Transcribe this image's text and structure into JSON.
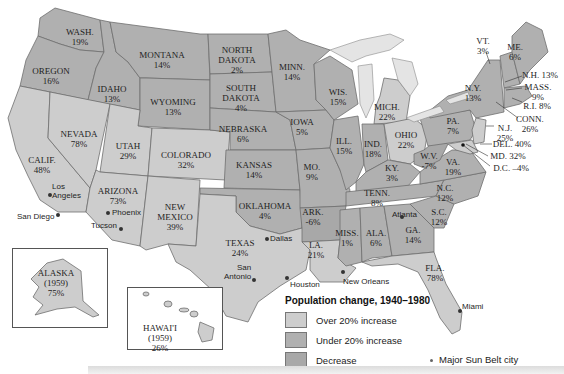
{
  "legend": {
    "title": "Population change, 1940–1980",
    "items": [
      {
        "label": "Over 20% increase",
        "color": "#cdcdcd"
      },
      {
        "label": "Under 20% increase",
        "color": "#b0b0b0"
      },
      {
        "label": "Decrease",
        "color": "#a8a8a8"
      }
    ],
    "city_marker_label": "Major Sun Belt city"
  },
  "states": {
    "wash": {
      "name": "WASH.",
      "value": "19%"
    },
    "oregon": {
      "name": "OREGON",
      "value": "16%"
    },
    "idaho": {
      "name": "IDAHO",
      "value": "13%"
    },
    "montana": {
      "name": "MONTANA",
      "value": "14%"
    },
    "wyoming": {
      "name": "WYOMING",
      "value": "13%"
    },
    "nevada": {
      "name": "NEVADA",
      "value": "78%"
    },
    "calif": {
      "name": "CALIF.",
      "value": "48%"
    },
    "utah": {
      "name": "UTAH",
      "value": "29%"
    },
    "colorado": {
      "name": "COLORADO",
      "value": "32%"
    },
    "arizona": {
      "name": "ARIZONA",
      "value": "73%"
    },
    "new_mexico": {
      "name": "NEW MEXICO",
      "name1": "NEW",
      "name2": "MEXICO",
      "value": "39%"
    },
    "north_dakota": {
      "name1": "NORTH",
      "name2": "DAKOTA",
      "value": "2%"
    },
    "south_dakota": {
      "name1": "SOUTH",
      "name2": "DAKOTA",
      "value": "4%"
    },
    "nebraska": {
      "name": "NEBRASKA",
      "value": "6%"
    },
    "kansas": {
      "name": "KANSAS",
      "value": "14%"
    },
    "oklahoma": {
      "name": "OKLAHOMA",
      "value": "4%"
    },
    "texas": {
      "name": "TEXAS",
      "value": "24%"
    },
    "minn": {
      "name": "MINN.",
      "value": "14%"
    },
    "iowa": {
      "name": "IOWA",
      "value": "5%"
    },
    "mo": {
      "name": "MO.",
      "value": "9%"
    },
    "ark": {
      "name": "ARK.",
      "value": "-6%"
    },
    "la": {
      "name": "LA.",
      "value": "21%"
    },
    "wis": {
      "name": "WIS.",
      "value": "15%"
    },
    "ill": {
      "name": "ILL.",
      "value": "15%"
    },
    "mich": {
      "name": "MICH.",
      "value": "22%"
    },
    "ind": {
      "name": "IND.",
      "value": "18%"
    },
    "ohio": {
      "name": "OHIO",
      "value": "22%"
    },
    "ky": {
      "name": "KY.",
      "value": "3%"
    },
    "tenn": {
      "name": "TENN.",
      "value": "8%"
    },
    "miss": {
      "name": "MISS.",
      "value": "1%"
    },
    "ala": {
      "name": "ALA.",
      "value": "6%"
    },
    "ga": {
      "name": "GA.",
      "value": "14%"
    },
    "fla": {
      "name": "FLA.",
      "value": "78%"
    },
    "sc": {
      "name": "S.C.",
      "value": "12%"
    },
    "nc": {
      "name": "N.C.",
      "value": "12%"
    },
    "va": {
      "name": "VA.",
      "value": "19%"
    },
    "wv": {
      "name": "W.V.",
      "value": "-7%"
    },
    "pa": {
      "name": "PA.",
      "value": "7%"
    },
    "ny": {
      "name": "N.Y.",
      "value": "13%"
    },
    "vt": {
      "name": "VT.",
      "value": "3%"
    },
    "me": {
      "name": "ME.",
      "value": "6%"
    },
    "nh": {
      "label": "N.H. 13%"
    },
    "mass": {
      "name": "MASS.",
      "value": "9%"
    },
    "ri": {
      "label": "R.I. 8%"
    },
    "conn": {
      "name": "CONN.",
      "value": "26%"
    },
    "nj": {
      "name": "N.J.",
      "value": "25%"
    },
    "del": {
      "label": "DEL. 40%"
    },
    "md": {
      "label": "MD. 32%"
    },
    "dc": {
      "label": "D.C. –4%"
    },
    "alaska": {
      "name": "ALASKA",
      "year": "(1959)",
      "value": "75%"
    },
    "hawaii": {
      "name": "HAWAI'I",
      "year": "(1959)",
      "value": "26%"
    }
  },
  "cities": {
    "los_angeles1": "Los",
    "los_angeles2": "Angeles",
    "san_diego": "San Diego",
    "phoenix": "Phoenix",
    "tucson": "Tucson",
    "dallas": "Dallas",
    "san_antonio1": "San",
    "san_antonio2": "Antonio",
    "houston": "Houston",
    "new_orleans": "New Orleans",
    "atlanta": "Atlanta",
    "miami": "Miami"
  }
}
